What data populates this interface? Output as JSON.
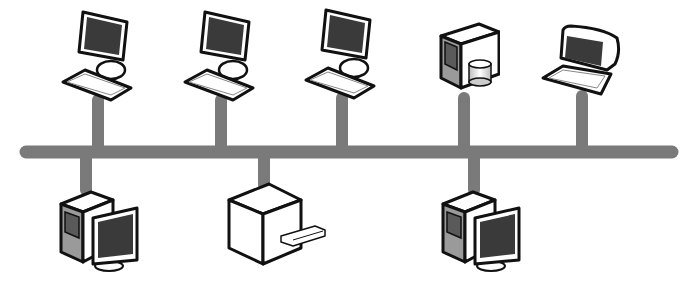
{
  "diagram": {
    "type": "bus-topology",
    "colors": {
      "background": "#ffffff",
      "bus": "#7a7a7a",
      "outline": "#111111",
      "screen": "#3a3a3a",
      "side_shade": "#9a9a9a",
      "face_light": "#ffffff"
    },
    "bus": {
      "x1": 28,
      "x2": 678,
      "y": 152,
      "thickness": 13
    },
    "top_devices": [
      {
        "id": "workstation-1",
        "kind": "desktop-computer",
        "stem_x": 98
      },
      {
        "id": "workstation-2",
        "kind": "desktop-computer",
        "stem_x": 221
      },
      {
        "id": "workstation-3",
        "kind": "desktop-computer",
        "stem_x": 342
      },
      {
        "id": "file-server",
        "kind": "server-with-storage",
        "stem_x": 464
      },
      {
        "id": "laptop",
        "kind": "laptop-computer",
        "stem_x": 582
      }
    ],
    "bottom_devices": [
      {
        "id": "tower-pc-1",
        "kind": "tower-with-monitor",
        "stem_x": 86
      },
      {
        "id": "printer",
        "kind": "printer",
        "stem_x": 264
      },
      {
        "id": "tower-pc-2",
        "kind": "tower-with-monitor",
        "stem_x": 474
      }
    ]
  }
}
